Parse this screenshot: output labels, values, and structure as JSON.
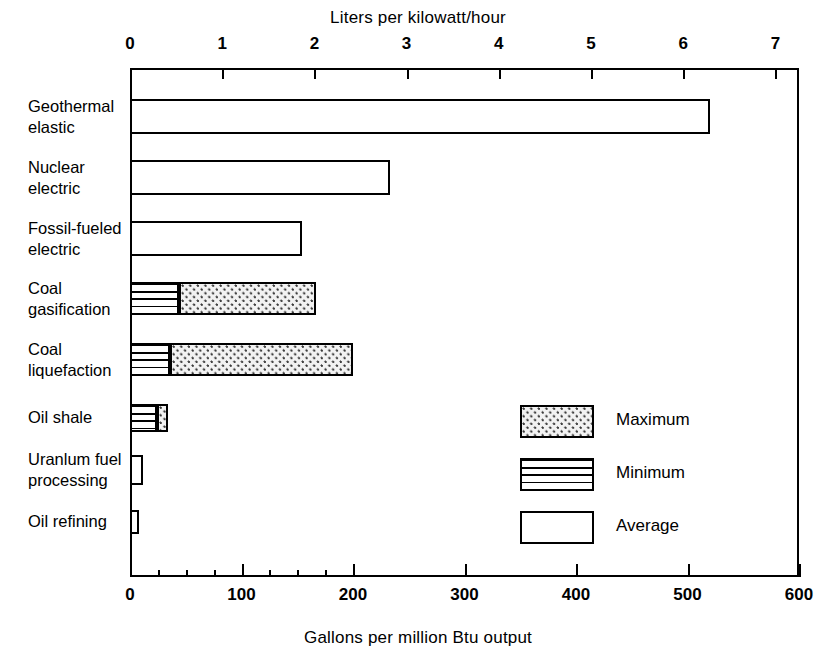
{
  "chart_data": {
    "type": "bar",
    "orientation": "horizontal",
    "title": "",
    "top_axis": {
      "label": "Liters per kilowatt/hour",
      "ticks": [
        0,
        1,
        2,
        3,
        4,
        5,
        6,
        7
      ],
      "tick_labels": [
        "0",
        "1",
        "2",
        "3",
        "4",
        "5",
        "6",
        "7"
      ],
      "range": [
        0,
        7.6
      ]
    },
    "bottom_axis": {
      "label": "Gallons per million Btu output",
      "ticks": [
        0,
        100,
        200,
        300,
        400,
        500,
        600
      ],
      "tick_labels": [
        "0",
        "100",
        "200",
        "300",
        "400",
        "500",
        "600"
      ],
      "minor_ticks": [
        25,
        50,
        75,
        125,
        150,
        175
      ],
      "range": [
        0,
        600
      ]
    },
    "xlabel": "Gallons per million Btu output",
    "ylabel": "",
    "xlim": [
      0,
      600
    ],
    "grid": false,
    "legend_position": "inside-right",
    "legend": [
      {
        "name": "Maximum",
        "pattern": "dotted"
      },
      {
        "name": "Minimum",
        "pattern": "horizontal-lines"
      },
      {
        "name": "Average",
        "pattern": "empty"
      }
    ],
    "categories": [
      "Geothermal elastic",
      "Nuclear electric",
      "Fossil-fueled electric",
      "Coal gasification",
      "Coal liquefaction",
      "Oil shale",
      "Uranlum fuel processing",
      "Oil refining"
    ],
    "category_lines": [
      [
        "Geothermal",
        "elastic"
      ],
      [
        "Nuclear",
        "electric"
      ],
      [
        "Fossil-fueled",
        "electric"
      ],
      [
        "Coal",
        "gasification"
      ],
      [
        "Coal",
        "liquefaction"
      ],
      [
        "Oil shale"
      ],
      [
        "Uranlum fuel",
        "processing"
      ],
      [
        "Oil refining"
      ]
    ],
    "series": [
      {
        "name": "Minimum",
        "values": [
          null,
          null,
          null,
          44,
          36,
          24,
          null,
          null
        ]
      },
      {
        "name": "Maximum",
        "values": [
          null,
          null,
          null,
          167,
          200,
          34,
          null,
          null
        ]
      },
      {
        "name": "Average",
        "values": [
          520,
          233,
          154,
          null,
          null,
          null,
          12,
          8
        ]
      }
    ],
    "bars": [
      {
        "category": "Geothermal elastic",
        "segments": [
          {
            "type": "Average",
            "start": 0,
            "end": 520
          }
        ]
      },
      {
        "category": "Nuclear electric",
        "segments": [
          {
            "type": "Average",
            "start": 0,
            "end": 233
          }
        ]
      },
      {
        "category": "Fossil-fueled electric",
        "segments": [
          {
            "type": "Average",
            "start": 0,
            "end": 154
          }
        ]
      },
      {
        "category": "Coal gasification",
        "segments": [
          {
            "type": "Minimum",
            "start": 0,
            "end": 44
          },
          {
            "type": "Maximum",
            "start": 44,
            "end": 167
          }
        ]
      },
      {
        "category": "Coal liquefaction",
        "segments": [
          {
            "type": "Minimum",
            "start": 0,
            "end": 36
          },
          {
            "type": "Maximum",
            "start": 36,
            "end": 200
          }
        ]
      },
      {
        "category": "Oil shale",
        "segments": [
          {
            "type": "Minimum",
            "start": 0,
            "end": 24
          },
          {
            "type": "Maximum",
            "start": 24,
            "end": 34
          }
        ]
      },
      {
        "category": "Uranlum fuel processing",
        "segments": [
          {
            "type": "Average",
            "start": 0,
            "end": 12
          }
        ]
      },
      {
        "category": "Oil refining",
        "segments": [
          {
            "type": "Average",
            "start": 0,
            "end": 8
          }
        ]
      }
    ],
    "colors": {
      "line": "#000000",
      "background": "#ffffff",
      "maximum_fill": "#f2f2f2",
      "minimum_fill": "#ffffff",
      "average_fill": "#ffffff"
    }
  },
  "top_axis_title": "Liters per kilowatt/hour",
  "bottom_axis_title": "Gallons per million Btu output",
  "top_tick_labels": [
    "0",
    "1",
    "2",
    "3",
    "4",
    "5",
    "6",
    "7"
  ],
  "bottom_tick_labels": [
    "0",
    "100",
    "200",
    "300",
    "400",
    "500",
    "600"
  ],
  "categories": [
    {
      "line1": "Geothermal",
      "line2": "elastic"
    },
    {
      "line1": "Nuclear",
      "line2": "electric"
    },
    {
      "line1": "Fossil-fueled",
      "line2": "electric"
    },
    {
      "line1": "Coal",
      "line2": "gasification"
    },
    {
      "line1": "Coal",
      "line2": "liquefaction"
    },
    {
      "line1": "Oil shale",
      "line2": ""
    },
    {
      "line1": "Uranlum fuel",
      "line2": "processing"
    },
    {
      "line1": "Oil refining",
      "line2": ""
    }
  ],
  "legend": {
    "maximum_label": "Maximum",
    "minimum_label": "Minimum",
    "average_label": "Average"
  }
}
